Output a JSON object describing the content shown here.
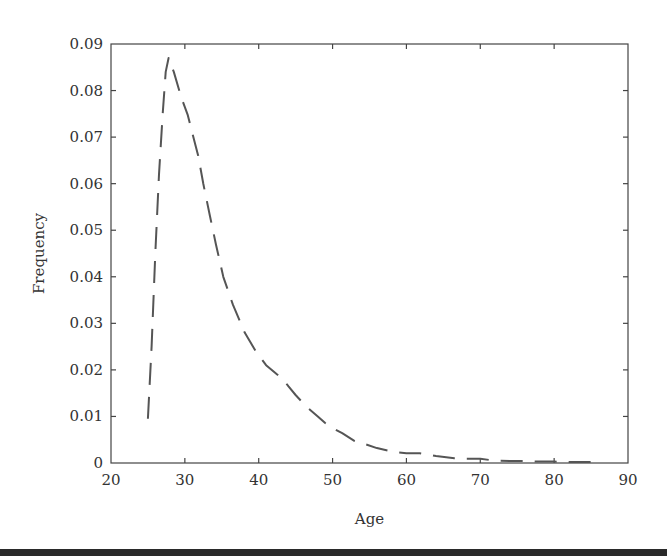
{
  "chart_data": {
    "type": "line",
    "title": "",
    "xlabel": "Age",
    "ylabel": "Frequency",
    "xlim": [
      20,
      90
    ],
    "ylim": [
      0,
      0.09
    ],
    "grid": false,
    "legend": null,
    "x_ticks": [
      20,
      30,
      40,
      50,
      60,
      70,
      80,
      90
    ],
    "y_ticks": [
      0,
      0.01,
      0.02,
      0.03,
      0.04,
      0.05,
      0.06,
      0.07,
      0.08,
      0.09
    ],
    "x_tick_labels": [
      "20",
      "30",
      "40",
      "50",
      "60",
      "70",
      "80",
      "90"
    ],
    "y_tick_labels": [
      "0",
      "0.01",
      "0.02",
      "0.03",
      "0.04",
      "0.05",
      "0.06",
      "0.07",
      "0.08",
      "0.09"
    ],
    "series": [
      {
        "name": "Frequency",
        "line_style": "dashed",
        "color": "#555555",
        "x": [
          25,
          25.5,
          26,
          26.5,
          27,
          27.4,
          27.8,
          28.5,
          29.5,
          30.4,
          31,
          31.8,
          32.5,
          33.4,
          34.2,
          35.2,
          36.5,
          38.1,
          39.6,
          41,
          42.5,
          43.3,
          44,
          45,
          46.5,
          48,
          49,
          50,
          51.3,
          53,
          54.5,
          56,
          58.6,
          60,
          61.8,
          63,
          64,
          66.5,
          68,
          70,
          72,
          74,
          76,
          78,
          80,
          82,
          84,
          85
        ],
        "values": [
          0.0095,
          0.025,
          0.045,
          0.062,
          0.075,
          0.084,
          0.087,
          0.084,
          0.0786,
          0.0747,
          0.071,
          0.066,
          0.06,
          0.053,
          0.047,
          0.04,
          0.034,
          0.028,
          0.024,
          0.021,
          0.019,
          0.018,
          0.0165,
          0.0146,
          0.012,
          0.01,
          0.0086,
          0.0075,
          0.0064,
          0.0047,
          0.004,
          0.0032,
          0.0023,
          0.0021,
          0.0021,
          0.0018,
          0.0015,
          0.001,
          0.0009,
          0.0009,
          0.0005,
          0.0004,
          0.0004,
          0.0003,
          0.0003,
          0.0002,
          0.0002,
          0.0002
        ]
      }
    ]
  },
  "layout": {
    "plot_left": 111,
    "plot_right": 628,
    "plot_top": 44,
    "plot_bottom": 463
  }
}
